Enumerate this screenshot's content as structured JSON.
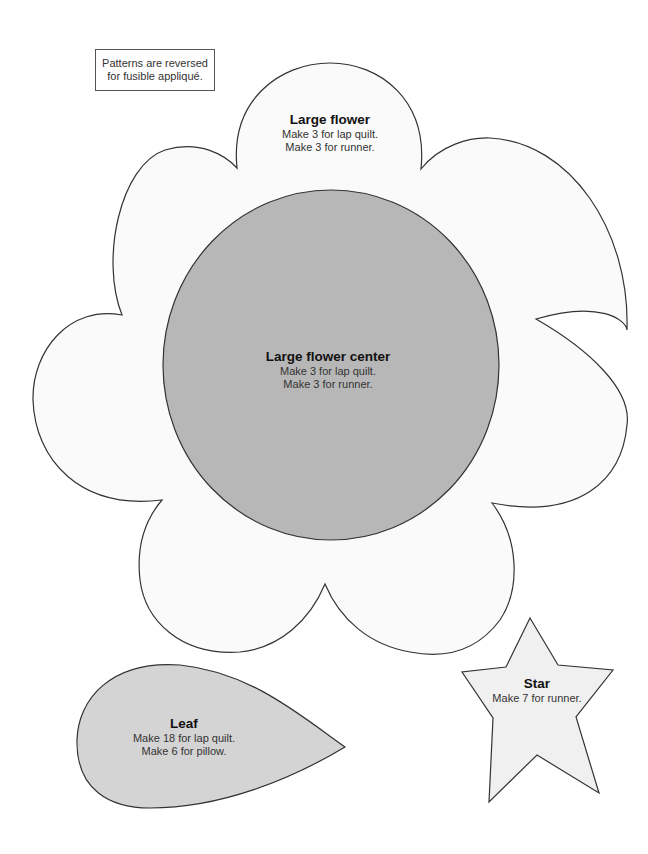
{
  "note": {
    "line1": "Patterns are reversed",
    "line2": "for fusible appliqué."
  },
  "colors": {
    "flower_fill": "#fafafa",
    "center_fill": "#b7b7b7",
    "leaf_fill": "#d4d4d4",
    "star_fill": "#f0f0f0",
    "outline": "#333333"
  },
  "patterns": [
    {
      "id": "large-flower",
      "title": "Large flower",
      "lines": [
        "Make 3 for lap quilt.",
        "Make 3 for runner."
      ]
    },
    {
      "id": "large-flower-center",
      "title": "Large flower center",
      "lines": [
        "Make 3 for lap quilt.",
        "Make 3 for runner."
      ]
    },
    {
      "id": "leaf",
      "title": "Leaf",
      "lines": [
        "Make 18 for lap quilt.",
        "Make 6 for pillow."
      ]
    },
    {
      "id": "star",
      "title": "Star",
      "lines": [
        "Make 7 for runner."
      ]
    }
  ]
}
